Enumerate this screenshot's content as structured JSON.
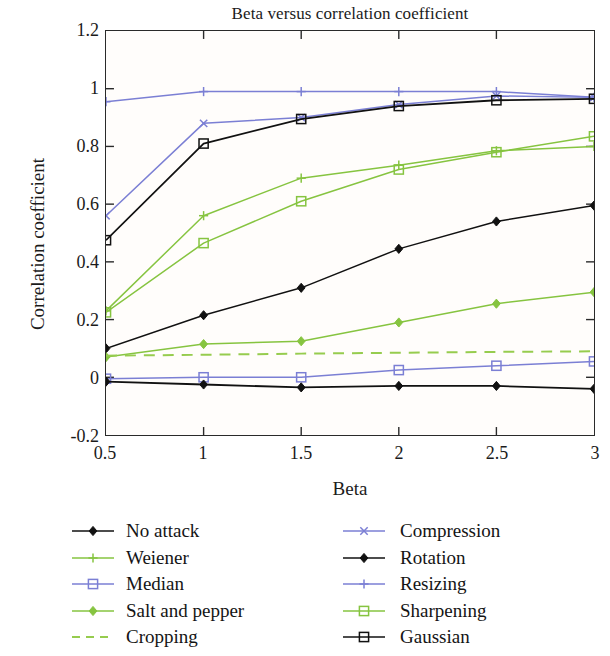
{
  "chart_data": {
    "type": "line",
    "title": "Beta versus correlation coefficient",
    "xlabel": "Beta",
    "ylabel": "Correlation coefficient",
    "x": [
      0.5,
      1,
      1.5,
      2,
      2.5,
      3
    ],
    "xtick_labels": [
      "0.5",
      "1",
      "1.5",
      "2",
      "2.5",
      "3"
    ],
    "ytick_labels": [
      "-0.2",
      "0",
      "0.2",
      "0.4",
      "0.6",
      "0.8",
      "1",
      "1.2"
    ],
    "ytick_values": [
      -0.2,
      0,
      0.2,
      0.4,
      0.6,
      0.8,
      1,
      1.2
    ],
    "xlim": [
      0.5,
      3
    ],
    "ylim": [
      -0.2,
      1.2
    ],
    "grid": false,
    "legend_position": "below-plot-two-columns",
    "series": [
      {
        "name": "No attack",
        "color": "#111111",
        "marker": "diamond",
        "dash": "solid",
        "values": [
          -0.015,
          -0.025,
          -0.035,
          -0.03,
          -0.03,
          -0.04
        ]
      },
      {
        "name": "Weiener",
        "color": "#86c440",
        "marker": "plus",
        "dash": "solid",
        "values": [
          0.23,
          0.56,
          0.69,
          0.735,
          0.785,
          0.8
        ]
      },
      {
        "name": "Median",
        "color": "#7b7fd4",
        "marker": "square",
        "dash": "solid",
        "values": [
          -0.005,
          0.0,
          0.0,
          0.025,
          0.04,
          0.055
        ]
      },
      {
        "name": "Salt and pepper",
        "color": "#86c440",
        "marker": "diamond",
        "dash": "solid",
        "values": [
          0.07,
          0.115,
          0.125,
          0.19,
          0.255,
          0.295
        ]
      },
      {
        "name": "Cropping",
        "color": "#96cc4e",
        "marker": "none",
        "dash": "dashed",
        "values": [
          0.075,
          0.078,
          0.082,
          0.085,
          0.088,
          0.09
        ]
      },
      {
        "name": "Compression",
        "color": "#7b7fd4",
        "marker": "x",
        "dash": "solid",
        "values": [
          0.56,
          0.88,
          0.9,
          0.945,
          0.975,
          0.97
        ]
      },
      {
        "name": "Rotation",
        "color": "#111111",
        "marker": "diamond",
        "dash": "solid",
        "values": [
          0.1,
          0.215,
          0.31,
          0.445,
          0.54,
          0.595
        ]
      },
      {
        "name": "Resizing",
        "color": "#7b7fd4",
        "marker": "plus",
        "dash": "solid",
        "values": [
          0.955,
          0.99,
          0.99,
          0.99,
          0.99,
          0.97
        ]
      },
      {
        "name": "Sharpening",
        "color": "#86c440",
        "marker": "square",
        "dash": "solid",
        "values": [
          0.225,
          0.465,
          0.61,
          0.72,
          0.78,
          0.835
        ]
      },
      {
        "name": "Gaussian",
        "color": "#111111",
        "marker": "square",
        "dash": "solid",
        "values": [
          0.475,
          0.81,
          0.895,
          0.94,
          0.96,
          0.965
        ]
      }
    ]
  },
  "legend": {
    "columns": [
      {
        "items": [
          "No attack",
          "Weiener",
          "Median",
          "Salt and pepper",
          "Cropping"
        ]
      },
      {
        "items": [
          "Compression",
          "Rotation",
          "Resizing",
          "Sharpening",
          "Gaussian"
        ]
      }
    ]
  }
}
